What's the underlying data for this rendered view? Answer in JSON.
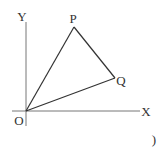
{
  "diagram": {
    "axes": {
      "x_label": "X",
      "y_label": "Y",
      "origin_label": "O"
    },
    "points": [
      {
        "name": "O",
        "label": "O"
      },
      {
        "name": "P",
        "label": "P"
      },
      {
        "name": "Q",
        "label": "Q"
      }
    ],
    "segments": [
      "OP",
      "PQ",
      "OQ"
    ],
    "trailing_mark": ")",
    "colors": {
      "line": "#333333",
      "axis": "#777777",
      "background": "#ffffff"
    }
  }
}
